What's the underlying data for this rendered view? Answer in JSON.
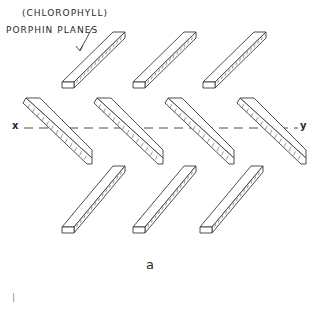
{
  "figure": {
    "annotation": {
      "line1": "(CHLOROPHYLL)",
      "line2": "PORPHIN  PLANES"
    },
    "axis": {
      "left_label": "x",
      "right_label": "y"
    },
    "caption": "a",
    "corner_mark": "|",
    "slabs": {
      "top_row": [
        {
          "orientation": "ascending",
          "x1": 62,
          "y1": 88,
          "x2": 125,
          "y2": 32
        },
        {
          "orientation": "ascending",
          "x1": 133,
          "y1": 88,
          "x2": 196,
          "y2": 32
        },
        {
          "orientation": "ascending",
          "x1": 203,
          "y1": 88,
          "x2": 266,
          "y2": 32
        }
      ],
      "middle_row": [
        {
          "orientation": "descending",
          "x1": 26,
          "y1": 98,
          "x2": 92,
          "y2": 164
        },
        {
          "orientation": "descending",
          "x1": 97,
          "y1": 98,
          "x2": 163,
          "y2": 164
        },
        {
          "orientation": "descending",
          "x1": 168,
          "y1": 98,
          "x2": 234,
          "y2": 164
        },
        {
          "orientation": "descending",
          "x1": 240,
          "y1": 98,
          "x2": 306,
          "y2": 164
        }
      ],
      "bottom_row": [
        {
          "orientation": "ascending",
          "x1": 62,
          "y1": 233,
          "x2": 125,
          "y2": 166
        },
        {
          "orientation": "ascending",
          "x1": 133,
          "y1": 233,
          "x2": 196,
          "y2": 166
        },
        {
          "orientation": "ascending",
          "x1": 200,
          "y1": 233,
          "x2": 263,
          "y2": 166
        }
      ]
    }
  }
}
